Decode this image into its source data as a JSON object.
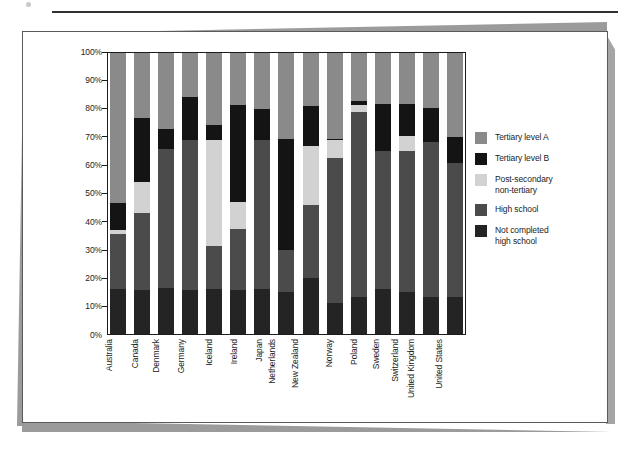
{
  "page": {
    "caption": "",
    "stray_mark": ""
  },
  "legend": {
    "position": "right",
    "items": [
      {
        "label": "Tertiary level A",
        "color": "#8a8a8a",
        "key": "tertiary_a"
      },
      {
        "label": "Tertiary level B",
        "color": "#141414",
        "key": "tertiary_b"
      },
      {
        "label": "Post-secondary\nnon-tertiary",
        "color": "#d2d2d2",
        "key": "post_secondary"
      },
      {
        "label": "High school",
        "color": "#4b4b4b",
        "key": "high_school"
      },
      {
        "label": "Not completed\nhigh school",
        "color": "#242424",
        "key": "not_completed"
      }
    ]
  },
  "chart_data": {
    "type": "bar",
    "stacked": true,
    "stack_total": 100,
    "title": "",
    "subtitle": "",
    "xlabel": "",
    "ylabel": "",
    "ylim": [
      0,
      100
    ],
    "yticks": [
      "0%",
      "10%",
      "20%",
      "30%",
      "40%",
      "50%",
      "60%",
      "70%",
      "80%",
      "90%",
      "100%"
    ],
    "ytick_values": [
      0,
      10,
      20,
      30,
      40,
      50,
      60,
      70,
      80,
      90,
      100
    ],
    "grid": false,
    "legend_position": "right",
    "categories": [
      "Australia",
      "Canada",
      "Denmark",
      "Germany",
      "Iceland",
      "Ireland",
      "Japan",
      "Netherlands",
      "New Zealand",
      "Norway",
      "Poland",
      "Sweden",
      "Switzerland",
      "United Kingdom",
      "United States"
    ],
    "series": [
      {
        "name": "Not completed high school",
        "color": "#242424",
        "values": [
          16,
          15.5,
          16.5,
          15.5,
          16,
          15.5,
          16,
          15,
          20,
          11,
          13,
          16,
          15,
          13,
          13
        ]
      },
      {
        "name": "High school",
        "color": "#4b4b4b",
        "values": [
          19.5,
          27.5,
          49.5,
          53.5,
          15.5,
          22,
          53,
          15,
          26,
          51.5,
          66,
          49,
          50,
          55.5,
          48
        ]
      },
      {
        "name": "Post-secondary non-tertiary",
        "color": "#d2d2d2",
        "values": [
          1.5,
          11,
          0,
          0,
          37.5,
          9.5,
          0,
          0,
          21,
          6.5,
          2.5,
          0,
          5.5,
          0,
          0
        ]
      },
      {
        "name": "Tertiary level B",
        "color": "#141414",
        "values": [
          9.5,
          23,
          7,
          15.5,
          5.5,
          34.5,
          11,
          39.5,
          14,
          0.5,
          1.5,
          17,
          11.5,
          12,
          9
        ]
      },
      {
        "name": "Tertiary level A",
        "color": "#8a8a8a",
        "values": [
          53.5,
          23,
          27,
          15.5,
          25.5,
          18.5,
          20,
          30.5,
          19,
          30.5,
          17,
          18,
          18,
          19.5,
          30
        ]
      }
    ],
    "stack_order_bottom_to_top": [
      "Not completed high school",
      "High school",
      "Post-secondary non-tertiary",
      "Tertiary level B",
      "Tertiary level A"
    ]
  }
}
